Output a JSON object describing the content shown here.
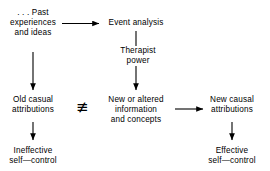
{
  "diagram": {
    "type": "flowchart",
    "title": "",
    "background_color": "#ffffff",
    "text_color": "#000000",
    "nodes": {
      "past_experiences": {
        "line1": ". . . Past",
        "line2": "experiences",
        "line3": "and ideas"
      },
      "event_analysis": {
        "line1": "Event analysis"
      },
      "therapist_power": {
        "line1": "Therapist",
        "line2": "power"
      },
      "old_casual_attributions": {
        "line1": "Old casual",
        "line2": "attributions"
      },
      "new_or_altered_information": {
        "line1": "New or altered",
        "line2": "information",
        "line3": "and concepts"
      },
      "new_causal_attributions": {
        "line1": "New causal",
        "line2": "attributions"
      },
      "ineffective_self_control": {
        "line1": "Ineffective",
        "line2": "self—control"
      },
      "effective_self_control": {
        "line1": "Effective",
        "line2": "self—control"
      }
    },
    "symbols": {
      "not_identical": "≢"
    },
    "edges": [
      {
        "from": "past_experiences",
        "to": "event_analysis",
        "direction": "right",
        "label": ""
      },
      {
        "from": "event_analysis",
        "to": "new_or_altered_information",
        "direction": "down",
        "label": "Therapist power"
      },
      {
        "from": "past_experiences",
        "to": "old_casual_attributions",
        "direction": "down",
        "label": ""
      },
      {
        "from": "old_casual_attributions",
        "to": "ineffective_self_control",
        "direction": "down",
        "label": ""
      },
      {
        "from": "new_or_altered_information",
        "to": "new_causal_attributions",
        "direction": "right",
        "label": ""
      },
      {
        "from": "new_causal_attributions",
        "to": "effective_self_control",
        "direction": "down",
        "label": ""
      }
    ],
    "relations": [
      {
        "left": "old_casual_attributions",
        "right": "new_or_altered_information",
        "symbol": "≢"
      }
    ]
  }
}
